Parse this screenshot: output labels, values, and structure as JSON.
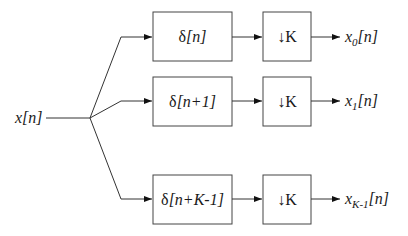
{
  "diagram": {
    "type": "block-diagram",
    "input": {
      "label": "x[n]"
    },
    "branches": [
      {
        "delay_label_prefix": "δ",
        "delay_label_arg": "[n]",
        "downsampler_label": "↓K",
        "output_base": "x",
        "output_sub": "0",
        "output_arg": "[n]"
      },
      {
        "delay_label_prefix": "δ",
        "delay_label_arg": "[n+1]",
        "downsampler_label": "↓K",
        "output_base": "x",
        "output_sub": "1",
        "output_arg": "[n]"
      },
      {
        "delay_label_prefix": "δ",
        "delay_label_arg": "[n+K-1]",
        "downsampler_label": "↓K",
        "output_base": "x",
        "output_sub": "K-1",
        "output_arg": "[n]"
      }
    ],
    "colors": {
      "line": "#333333",
      "box_border": "#444444",
      "text": "#1a1a1a",
      "background": "#ffffff"
    }
  }
}
